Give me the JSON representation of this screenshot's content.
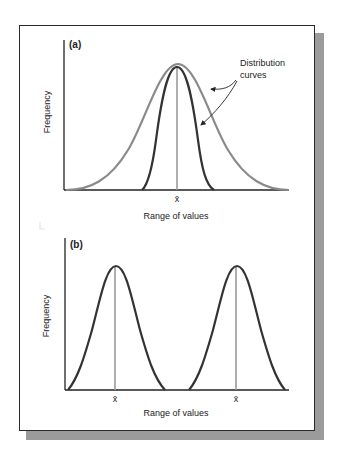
{
  "figure": {
    "panel_a": {
      "label": "(a)",
      "y_axis_label": "Frequency",
      "x_axis_label": "Range of values",
      "mean_label": "x̄",
      "annotation": {
        "line1": "Distribution",
        "line2": "curves"
      },
      "curves": [
        {
          "name": "wide-distribution-curve",
          "color": "#8a8a8a"
        },
        {
          "name": "narrow-distribution-curve",
          "color": "#333333"
        }
      ]
    },
    "panel_b": {
      "label": "(b)",
      "y_axis_label": "Frequency",
      "x_axis_label": "Range of values",
      "mean_labels": [
        "x̄",
        "x̄"
      ],
      "curves": [
        {
          "name": "left-distribution-curve",
          "color": "#333333"
        },
        {
          "name": "right-distribution-curve",
          "color": "#333333"
        }
      ]
    },
    "colors": {
      "axis": "#222222",
      "mean_line": "#9a9a9a",
      "frame_border": "#2a2a2a",
      "shadow": "#9b9b9b"
    }
  }
}
